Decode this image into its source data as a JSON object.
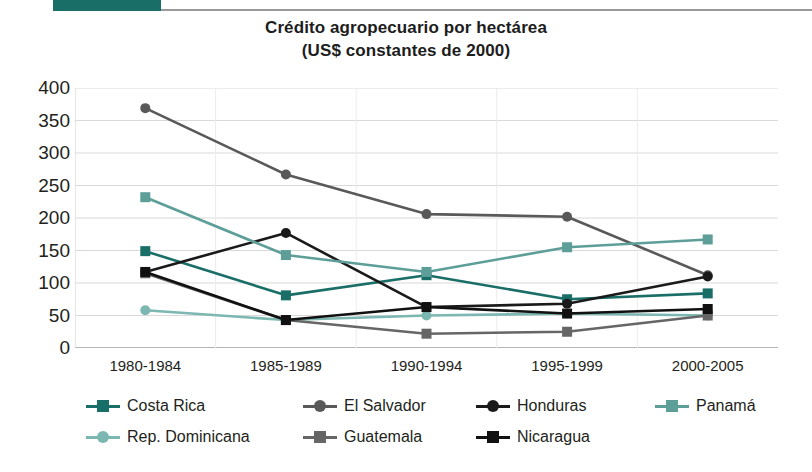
{
  "banner": {
    "tab_color": "#1a6e68",
    "rule_color": "#9a9a9a"
  },
  "header": {
    "title": "Crédito agropecuario por hectárea",
    "subtitle": "(US$ constantes de 2000)"
  },
  "chart_data": {
    "type": "line",
    "title": "Crédito agropecuario por hectárea",
    "subtitle": "(US$ constantes de 2000)",
    "xlabel": "",
    "ylabel": "",
    "categories": [
      "1980-1984",
      "1985-1989",
      "1990-1994",
      "1995-1999",
      "2000-2005"
    ],
    "ylim": [
      0,
      400
    ],
    "yticks": [
      0,
      50,
      100,
      150,
      200,
      250,
      300,
      350,
      400
    ],
    "grid": "horizontal",
    "legend_position": "bottom",
    "series": [
      {
        "name": "Costa Rica",
        "color": "#1a6e68",
        "marker": "square",
        "values": [
          149,
          81,
          112,
          75,
          84
        ]
      },
      {
        "name": "El Salvador",
        "color": "#595959",
        "marker": "circle",
        "values": [
          369,
          267,
          206,
          202,
          112
        ]
      },
      {
        "name": "Honduras",
        "color": "#1a1a1a",
        "marker": "circle",
        "values": [
          117,
          177,
          63,
          68,
          110
        ]
      },
      {
        "name": "Panamá",
        "color": "#5d9e98",
        "marker": "square",
        "values": [
          232,
          143,
          117,
          155,
          167
        ]
      },
      {
        "name": "Rep. Dominicana",
        "color": "#7cb7b1",
        "marker": "circle",
        "values": [
          58,
          43,
          50,
          53,
          50
        ]
      },
      {
        "name": "Guatemala",
        "color": "#666666",
        "marker": "square",
        "values": [
          115,
          43,
          22,
          25,
          50
        ]
      },
      {
        "name": "Nicaragua",
        "color": "#111111",
        "marker": "square",
        "values": [
          117,
          43,
          63,
          53,
          60
        ]
      }
    ]
  },
  "legend": {
    "rows": [
      [
        {
          "label": "Costa Rica",
          "color": "#1a6e68",
          "marker": "square",
          "x": 14
        },
        {
          "label": "El Salvador",
          "color": "#595959",
          "marker": "circle",
          "x": 231
        },
        {
          "label": "Honduras",
          "color": "#1a1a1a",
          "marker": "circle",
          "x": 404
        },
        {
          "label": "Panamá",
          "color": "#5d9e98",
          "marker": "square",
          "x": 583
        }
      ],
      [
        {
          "label": "Rep. Dominicana",
          "color": "#7cb7b1",
          "marker": "circle",
          "x": 14
        },
        {
          "label": "Guatemala",
          "color": "#666666",
          "marker": "square",
          "x": 231
        },
        {
          "label": "Nicaragua",
          "color": "#111111",
          "marker": "square",
          "x": 404
        }
      ]
    ]
  },
  "axis": {
    "y_labels": [
      "400",
      "350",
      "300",
      "250",
      "200",
      "150",
      "100",
      "50",
      "0"
    ],
    "x_labels": [
      "1980-1984",
      "1985-1989",
      "1990-1994",
      "1995-1999",
      "2000-2005"
    ]
  }
}
